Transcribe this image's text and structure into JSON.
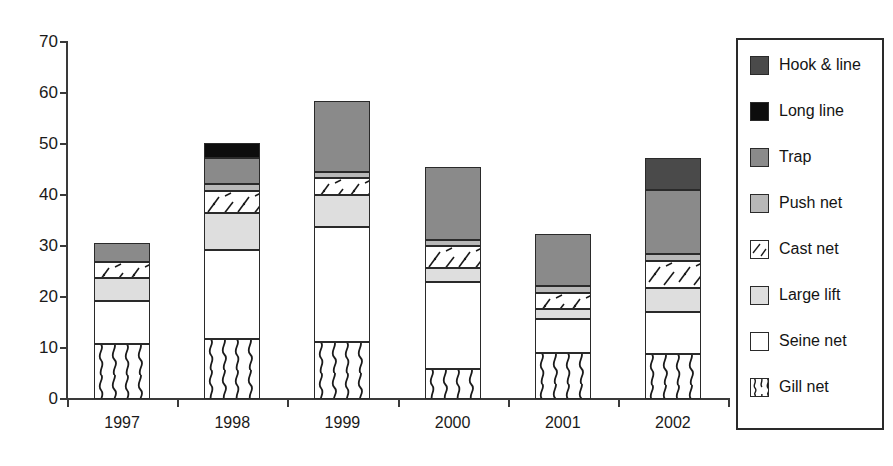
{
  "chart_data": {
    "type": "bar",
    "subtype": "stacked-bar",
    "title": "",
    "xlabel": "",
    "ylabel": "",
    "categories": [
      "1997",
      "1998",
      "1999",
      "2000",
      "2001",
      "2002"
    ],
    "ylim": [
      0,
      70
    ],
    "ytick_values": [
      0,
      10,
      20,
      30,
      40,
      50,
      60,
      70
    ],
    "ytick_labels": [
      "0",
      "10",
      "20",
      "30",
      "40",
      "50",
      "60",
      "70"
    ],
    "grid": false,
    "legend_position": "right",
    "stack_order_bottom_to_top": [
      "Gill net",
      "Seine net",
      "Large lift",
      "Cast net",
      "Push net",
      "Trap",
      "Long line",
      "Hook & line"
    ],
    "series": [
      {
        "name": "Gill net",
        "pattern": "wavy-lines",
        "color": "#ffffff",
        "values": [
          10.7,
          11.7,
          11.1,
          5.8,
          9.0,
          8.9
        ]
      },
      {
        "name": "Seine net",
        "pattern": "solid-white",
        "color": "#ffffff",
        "values": [
          8.5,
          17.6,
          22.6,
          17.1,
          6.6,
          8.2
        ]
      },
      {
        "name": "Large lift",
        "pattern": "light-gray",
        "color": "#dedede",
        "values": [
          4.5,
          7.2,
          6.3,
          2.8,
          2.0,
          4.7
        ]
      },
      {
        "name": "Cast net",
        "pattern": "diagonal-dashes",
        "color": "#ffffff",
        "values": [
          3.2,
          4.3,
          3.4,
          4.2,
          3.1,
          5.3
        ]
      },
      {
        "name": "Push net",
        "pattern": "mid-light-gray",
        "color": "#b8b8b8",
        "values": [
          0.0,
          1.4,
          1.2,
          1.2,
          1.4,
          1.4
        ]
      },
      {
        "name": "Trap",
        "pattern": "mid-gray",
        "color": "#8a8a8a",
        "values": [
          3.6,
          5.0,
          13.9,
          14.4,
          10.2,
          12.5
        ]
      },
      {
        "name": "Long line",
        "pattern": "black",
        "color": "#0d0d0d",
        "values": [
          0.0,
          3.0,
          0.0,
          0.0,
          0.0,
          0.0
        ]
      },
      {
        "name": "Hook & line",
        "pattern": "dark-gray",
        "color": "#4a4a4a",
        "values": [
          0.0,
          0.0,
          0.0,
          0.0,
          0.0,
          6.2
        ]
      }
    ],
    "totals": [
      30.5,
      50.2,
      58.5,
      45.5,
      32.3,
      47.2
    ]
  },
  "legend": {
    "items": [
      {
        "label": "Hook & line",
        "swatch": "dark-gray"
      },
      {
        "label": "Long line",
        "swatch": "black"
      },
      {
        "label": "Trap",
        "swatch": "mid-gray"
      },
      {
        "label": "Push net",
        "swatch": "mid-light-gray"
      },
      {
        "label": "Cast net",
        "swatch": "diagonal-dashes"
      },
      {
        "label": "Large lift",
        "swatch": "light-gray"
      },
      {
        "label": "Seine net",
        "swatch": "solid-white"
      },
      {
        "label": "Gill net",
        "swatch": "wavy-lines"
      }
    ]
  }
}
